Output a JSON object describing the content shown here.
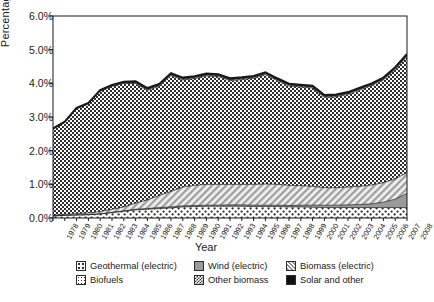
{
  "chart_data": {
    "type": "area",
    "title": "",
    "xlabel": "Year",
    "ylabel": "Percentage",
    "ylim": [
      0,
      6
    ],
    "ytick_labels": [
      "0.0%",
      "1.0%",
      "2.0%",
      "3.0%",
      "4.0%",
      "5.0%",
      "6.0%"
    ],
    "ytick_values": [
      0,
      1,
      2,
      3,
      4,
      5,
      6
    ],
    "grid": false,
    "stacked": true,
    "legend_position": "bottom",
    "categories": [
      "1978",
      "1979",
      "1980",
      "1981",
      "1982",
      "1983",
      "1984",
      "1985",
      "1986",
      "1987",
      "1988",
      "1989",
      "1990",
      "1991",
      "1992",
      "1993",
      "1994",
      "1995",
      "1996",
      "1997",
      "1998",
      "1999",
      "2000",
      "2001",
      "2002",
      "2003",
      "2004",
      "2005",
      "2006",
      "2007",
      "2008"
    ],
    "series": [
      {
        "name": "Geothermal (electric)",
        "pattern": "sparse-dots",
        "values": [
          0.06,
          0.08,
          0.09,
          0.1,
          0.12,
          0.16,
          0.2,
          0.24,
          0.26,
          0.28,
          0.3,
          0.33,
          0.34,
          0.35,
          0.35,
          0.35,
          0.35,
          0.34,
          0.34,
          0.34,
          0.33,
          0.33,
          0.32,
          0.31,
          0.31,
          0.31,
          0.31,
          0.31,
          0.31,
          0.31,
          0.31
        ]
      },
      {
        "name": "Wind (electric)",
        "pattern": "solid-gray",
        "values": [
          0.0,
          0.0,
          0.0,
          0.0,
          0.0,
          0.01,
          0.01,
          0.02,
          0.02,
          0.03,
          0.03,
          0.03,
          0.03,
          0.03,
          0.03,
          0.04,
          0.04,
          0.04,
          0.04,
          0.04,
          0.04,
          0.05,
          0.06,
          0.07,
          0.07,
          0.08,
          0.09,
          0.11,
          0.16,
          0.25,
          0.42
        ]
      },
      {
        "name": "Biomass (electric)",
        "pattern": "diagonal-hatch",
        "values": [
          0.02,
          0.03,
          0.04,
          0.05,
          0.07,
          0.09,
          0.12,
          0.18,
          0.26,
          0.36,
          0.46,
          0.56,
          0.6,
          0.62,
          0.62,
          0.61,
          0.61,
          0.62,
          0.63,
          0.62,
          0.6,
          0.58,
          0.56,
          0.52,
          0.52,
          0.53,
          0.54,
          0.56,
          0.58,
          0.6,
          0.62
        ]
      },
      {
        "name": "Other biomass",
        "pattern": "checkerboard",
        "values": [
          2.56,
          2.73,
          3.11,
          3.24,
          3.58,
          3.65,
          3.67,
          3.55,
          3.25,
          3.24,
          3.44,
          3.18,
          3.17,
          3.22,
          3.2,
          3.08,
          3.11,
          3.15,
          3.25,
          3.08,
          2.95,
          2.93,
          2.92,
          2.68,
          2.7,
          2.75,
          2.86,
          2.95,
          3.05,
          3.25,
          3.45
        ]
      },
      {
        "name": "Biofuels",
        "pattern": "fine-dots",
        "values": [
          0.0,
          0.0,
          0.01,
          0.01,
          0.01,
          0.02,
          0.02,
          0.03,
          0.03,
          0.03,
          0.03,
          0.03,
          0.03,
          0.03,
          0.03,
          0.03,
          0.03,
          0.03,
          0.03,
          0.03,
          0.03,
          0.03,
          0.03,
          0.03,
          0.03,
          0.03,
          0.03,
          0.03,
          0.03,
          0.03,
          0.03
        ]
      },
      {
        "name": "Solar and other",
        "pattern": "solid-black",
        "values": [
          0.02,
          0.02,
          0.02,
          0.02,
          0.02,
          0.02,
          0.03,
          0.04,
          0.04,
          0.04,
          0.04,
          0.04,
          0.04,
          0.04,
          0.04,
          0.04,
          0.04,
          0.04,
          0.04,
          0.04,
          0.04,
          0.04,
          0.04,
          0.04,
          0.04,
          0.04,
          0.04,
          0.04,
          0.04,
          0.04,
          0.04
        ]
      }
    ],
    "totals": [
      2.66,
      2.86,
      3.27,
      3.42,
      3.8,
      3.93,
      4.05,
      4.06,
      3.86,
      3.98,
      4.3,
      4.17,
      4.21,
      4.29,
      4.27,
      4.15,
      4.18,
      4.22,
      4.33,
      4.15,
      3.99,
      3.96,
      3.93,
      3.65,
      3.67,
      3.74,
      3.87,
      4.0,
      4.17,
      4.48,
      4.87
    ],
    "legend": [
      "Geothermal (electric)",
      "Wind (electric)",
      "Biomass (electric)",
      "Biofuels",
      "Other biomass",
      "Solar and other"
    ],
    "colors": {
      "axis": "#1a1a1a",
      "geothermal": "#ffffff",
      "wind": "#9a9a9a",
      "biomass_electric": "#e2e2e2",
      "other_biomass": "#8f8f8f",
      "biofuels": "#ffffff",
      "solar_other": "#111111"
    }
  }
}
